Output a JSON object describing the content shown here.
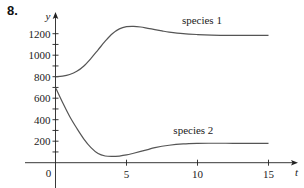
{
  "problem_number": "8.",
  "chart_data": {
    "type": "line",
    "title": "",
    "xlabel": "t",
    "ylabel": "y",
    "xlim": [
      0,
      16
    ],
    "ylim": [
      0,
      1300
    ],
    "x_ticks": [
      5,
      10,
      15
    ],
    "x_tick_labels": [
      "5",
      "10",
      "15"
    ],
    "y_ticks": [
      100,
      200,
      300,
      400,
      500,
      600,
      700,
      800,
      900,
      1000,
      1100,
      1200
    ],
    "y_tick_labels": [
      {
        "value": 200,
        "label": "200"
      },
      {
        "value": 400,
        "label": "400"
      },
      {
        "value": 600,
        "label": "600"
      },
      {
        "value": 800,
        "label": "800"
      },
      {
        "value": 1000,
        "label": "1000"
      },
      {
        "value": 1200,
        "label": "1200"
      }
    ],
    "origin_label": "0",
    "grid": false,
    "legend": "inline labels",
    "series": [
      {
        "name": "species 1",
        "label_pos": {
          "t": 8.9,
          "y": 1290
        },
        "x": [
          0,
          0.5,
          1,
          1.5,
          2,
          2.5,
          3,
          3.5,
          4,
          4.5,
          5,
          5.5,
          6,
          6.5,
          7,
          7.5,
          8,
          9,
          10,
          11,
          12,
          13,
          14,
          15
        ],
        "values": [
          800,
          805,
          820,
          850,
          900,
          970,
          1050,
          1130,
          1200,
          1245,
          1265,
          1268,
          1262,
          1250,
          1238,
          1226,
          1215,
          1200,
          1192,
          1187,
          1185,
          1184,
          1184,
          1184
        ]
      },
      {
        "name": "species 2",
        "label_pos": {
          "t": 8.3,
          "y": 270
        },
        "x": [
          0,
          0.5,
          1,
          1.5,
          2,
          2.5,
          3,
          3.5,
          4,
          4.5,
          5,
          5.5,
          6,
          6.5,
          7,
          8,
          9,
          10,
          11,
          12,
          13,
          14,
          15
        ],
        "values": [
          700,
          560,
          430,
          320,
          220,
          140,
          85,
          62,
          58,
          62,
          72,
          88,
          105,
          122,
          140,
          162,
          175,
          180,
          181,
          181,
          180,
          180,
          180
        ]
      }
    ]
  }
}
